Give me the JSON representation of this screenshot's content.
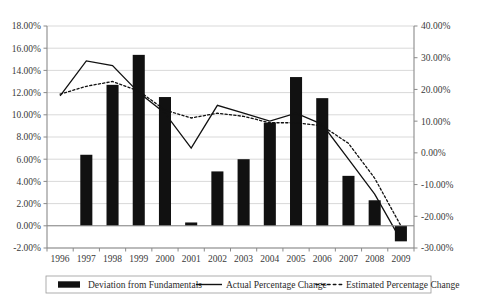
{
  "chart_data": {
    "type": "bar",
    "title": "",
    "subtitle": "",
    "xlabel": "",
    "ylabel": "",
    "y2label": "",
    "grid": true,
    "legend_position": "bottom",
    "categories": [
      "1996",
      "1997",
      "1998",
      "1999",
      "2000",
      "2001",
      "2002",
      "2003",
      "2004",
      "2005",
      "2006",
      "2007",
      "2008",
      "2009"
    ],
    "ylim": [
      -2.0,
      18.0
    ],
    "yticks": [
      "-2.00%",
      "0.00%",
      "2.00%",
      "4.00%",
      "6.00%",
      "8.00%",
      "10.00%",
      "12.00%",
      "14.00%",
      "16.00%",
      "18.00%"
    ],
    "ytick_values": [
      -2.0,
      0.0,
      2.0,
      4.0,
      6.0,
      8.0,
      10.0,
      12.0,
      14.0,
      16.0,
      18.0
    ],
    "y2lim": [
      -30.0,
      40.0
    ],
    "y2ticks": [
      "-30.00%",
      "-20.00%",
      "-10.00%",
      "0.00%",
      "10.00%",
      "20.00%",
      "30.00%",
      "40.00%"
    ],
    "y2tick_values": [
      -30.0,
      -20.0,
      -10.0,
      0.0,
      10.0,
      20.0,
      30.0,
      40.0
    ],
    "series": [
      {
        "name": "Deviation from Fundamentals",
        "type": "bar",
        "axis": "left",
        "color": "#111111",
        "values": [
          0.0,
          6.4,
          12.7,
          15.4,
          11.6,
          0.3,
          4.9,
          6.0,
          9.3,
          13.4,
          11.5,
          4.5,
          2.3,
          -1.4
        ]
      },
      {
        "name": "Actual Percentage Change",
        "type": "line",
        "style": "solid",
        "axis": "right",
        "color": "#111111",
        "values": [
          18.0,
          29.0,
          27.5,
          19.0,
          12.5,
          1.5,
          15.0,
          12.5,
          10.0,
          12.5,
          9.0,
          -2.0,
          -13.0,
          -27.5
        ]
      },
      {
        "name": "Estimated Percentage Change",
        "type": "line",
        "style": "dotted",
        "axis": "right",
        "color": "#111111",
        "values": [
          18.5,
          21.0,
          22.5,
          19.5,
          13.5,
          11.0,
          12.5,
          11.5,
          9.5,
          9.5,
          8.5,
          3.0,
          -8.0,
          -23.0
        ]
      }
    ]
  },
  "legend": {
    "items": [
      {
        "label": "Deviation from Fundamentals",
        "marker": "bar-swatch-icon"
      },
      {
        "label": "Actual Percentage Change",
        "marker": "solid-line-icon"
      },
      {
        "label": "Estimated Percentage Change",
        "marker": "dotted-line-icon"
      }
    ]
  }
}
